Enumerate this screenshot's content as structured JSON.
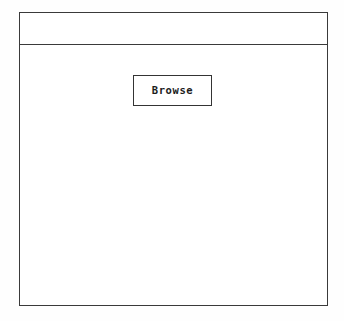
{
  "window": {
    "title_bar": {
      "label": ""
    },
    "content": {
      "browse_button": {
        "label": "Browse",
        "icon": "none"
      }
    }
  },
  "colors": {
    "page_background": "#fefefe",
    "window_background": "#ffffff",
    "frame_border": "#3a3a3a",
    "button_border": "#343434",
    "button_text": "#1d1d1d"
  }
}
